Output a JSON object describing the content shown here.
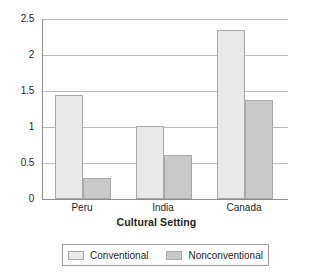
{
  "chart_data": {
    "type": "bar",
    "title": "",
    "subtitle": "",
    "xlabel": "Cultural Setting",
    "ylabel": "",
    "categories": [
      "Peru",
      "India",
      "Canada"
    ],
    "series": [
      {
        "name": "Conventional",
        "values": [
          1.44,
          1.01,
          2.35
        ]
      },
      {
        "name": "Nonconventional",
        "values": [
          0.29,
          0.61,
          1.37
        ]
      }
    ],
    "ylim": [
      0,
      2.5
    ],
    "yticks": [
      0,
      0.5,
      1,
      1.5,
      2,
      2.5
    ],
    "ytick_labels": [
      "0",
      "0.5",
      "1",
      "1.5",
      "2",
      "2.5"
    ],
    "grid": true,
    "grid_axis": "y",
    "legend": {
      "position": "bottom",
      "border": true
    },
    "colors": {
      "series_0_fill": "#e9e9e9",
      "series_1_fill": "#c9c9c9",
      "bar_stroke": "#a8a8a8",
      "gridline": "#b9b9b9",
      "axis": "#8c8c8c",
      "text": "#231f20",
      "background": "#ffffff"
    }
  }
}
